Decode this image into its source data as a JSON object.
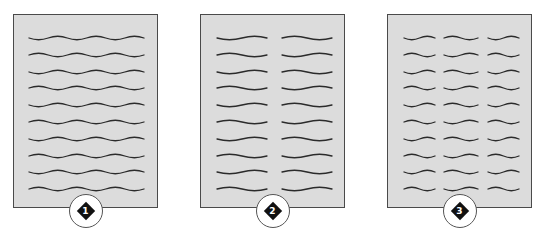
{
  "figure": {
    "colors": {
      "page_fill": "#dcdcdc",
      "page_border": "#4a4a4a",
      "line_stroke": "#2b2b2b",
      "badge_fill": "#ffffff",
      "diamond_fill": "#111111"
    },
    "pages": [
      {
        "label": "1",
        "columns": 1,
        "lines_per_column": 10,
        "box": {
          "x": 13,
          "y": 14,
          "w": 145,
          "h": 194
        },
        "column_spans": [
          [
            28,
            143
          ]
        ]
      },
      {
        "label": "2",
        "columns": 2,
        "lines_per_column": 10,
        "box": {
          "x": 200,
          "y": 14,
          "w": 145,
          "h": 194
        },
        "column_spans": [
          [
            216,
            266
          ],
          [
            281,
            331
          ]
        ]
      },
      {
        "label": "3",
        "columns": 3,
        "lines_per_column": 10,
        "box": {
          "x": 387,
          "y": 14,
          "w": 145,
          "h": 194
        },
        "column_spans": [
          [
            403,
            434
          ],
          [
            443,
            477
          ],
          [
            487,
            518
          ]
        ]
      }
    ],
    "line_rows_y": [
      37,
      54,
      71,
      87,
      104,
      121,
      138,
      155,
      171,
      188
    ]
  }
}
